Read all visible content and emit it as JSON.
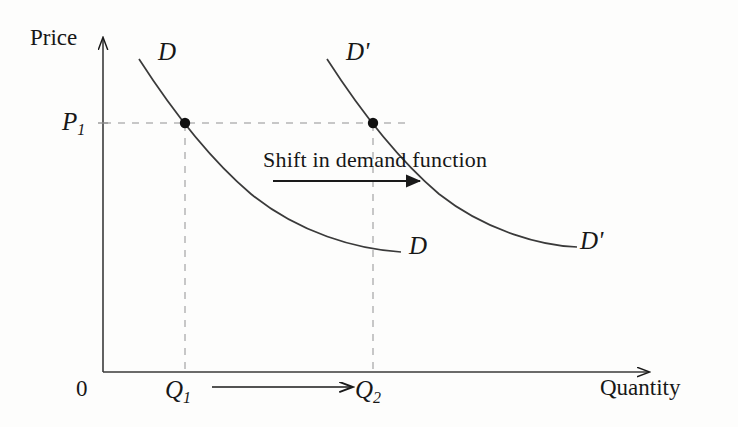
{
  "figure": {
    "type": "economics-supply-demand-diagram",
    "background_color": "#fdfdfc",
    "ink_color": "#1a1a1a",
    "dash_color": "#b9b9b9"
  },
  "axes": {
    "y_title": "Price",
    "x_title": "Quantity",
    "origin_label": "0",
    "y_axis": {
      "x": 103,
      "top": 35,
      "bottom": 372
    },
    "x_axis": {
      "y": 372,
      "left": 103,
      "right": 652
    }
  },
  "ticks": {
    "price_level": {
      "label": "P",
      "subscript": "1",
      "y": 123
    },
    "quantity_1": {
      "label": "Q",
      "subscript": "1",
      "x": 185
    },
    "quantity_2": {
      "label": "Q",
      "subscript": "2",
      "x": 373
    }
  },
  "curves": [
    {
      "name": "demand-original",
      "label_top": "D",
      "label_bottom": "D",
      "path": "M 139,59 C 175,110 215,160 260,198 C 305,232 355,248 401,252",
      "label_top_pos": {
        "x": 160,
        "y": 40
      },
      "label_bottom_pos": {
        "x": 409,
        "y": 234
      }
    },
    {
      "name": "demand-shifted",
      "label_top": "D'",
      "label_bottom": "D'",
      "path": "M 327,59 C 363,110 403,160 448,198 C 490,231 538,245 577,247",
      "label_top_pos": {
        "x": 348,
        "y": 40
      },
      "label_bottom_pos": {
        "x": 582,
        "y": 229
      }
    }
  ],
  "points": [
    {
      "name": "equilibrium-original",
      "x": 185,
      "y": 123
    },
    {
      "name": "equilibrium-shifted",
      "x": 373,
      "y": 123
    }
  ],
  "annotation": {
    "text": "Shift in demand function",
    "text_pos": {
      "x": 263,
      "y": 149
    },
    "arrow": {
      "x1": 273,
      "x2": 422,
      "y": 181
    }
  },
  "quantity_shift_arrow": {
    "x1": 212,
    "x2": 352,
    "y": 387
  },
  "dashed_guides": {
    "horizontal_price": {
      "y": 123,
      "x1": 103,
      "x2": 405
    },
    "vertical_q1": {
      "x": 185,
      "y1": 123,
      "y2": 372
    },
    "vertical_q2": {
      "x": 373,
      "y1": 123,
      "y2": 372
    }
  }
}
